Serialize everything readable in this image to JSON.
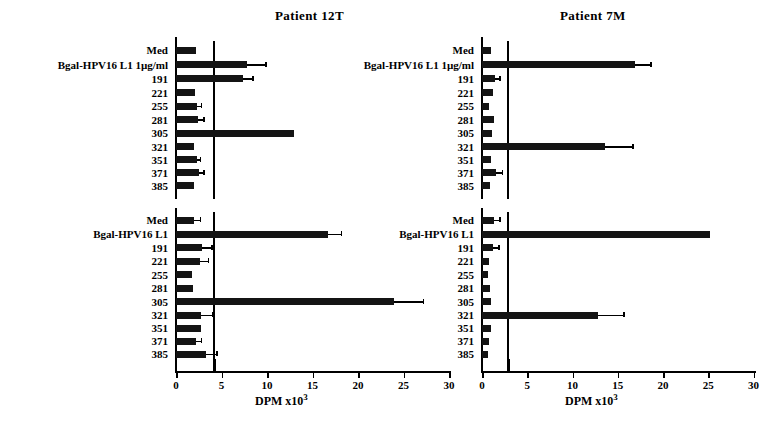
{
  "figure": {
    "width": 779,
    "height": 436,
    "background": "#ffffff",
    "ink_color": "#141414"
  },
  "axis_title": {
    "text": "DPM  x10",
    "exponent": "3"
  },
  "chart_data": {
    "type": "bar",
    "orientation": "horizontal",
    "title": "",
    "xlabel": "DPM x10³",
    "ylabel": "",
    "xlim": [
      0,
      30
    ],
    "xticks": [
      0,
      5,
      10,
      15,
      20,
      25,
      30
    ],
    "xtick_labels": [
      "0",
      "5",
      "10",
      "15",
      "20",
      "25",
      "30"
    ],
    "grid": false,
    "legend": false,
    "note": "Four panels: two patients (columns) x two assays (rows). Bars are mean DPM x10^3 with positive error bars. A vertical reference line marks the background/cut-off value in each panel.",
    "panels": [
      {
        "panel_id": "patient-12t-top",
        "patient": "Patient  12T",
        "column": "left",
        "row": "top",
        "reference_line_value": 4.1,
        "categories": [
          "Med",
          "Bgal-HPV16 L1  1µg/ml",
          "191",
          "221",
          "255",
          "281",
          "305",
          "321",
          "351",
          "371",
          "385"
        ],
        "values": [
          2.2,
          7.8,
          7.4,
          2.1,
          2.3,
          2.4,
          13.0,
          2.0,
          2.3,
          2.5,
          2.0
        ],
        "errors": [
          0.0,
          2.0,
          1.0,
          0.0,
          0.4,
          0.6,
          0.0,
          0.0,
          0.3,
          0.5,
          0.0
        ]
      },
      {
        "panel_id": "patient-12t-bottom",
        "patient": "",
        "column": "left",
        "row": "bottom",
        "reference_line_value": 4.1,
        "categories": [
          "Med",
          "Bgal-HPV16 L1",
          "191",
          "221",
          "255",
          "281",
          "305",
          "321",
          "351",
          "371",
          "385"
        ],
        "values": [
          2.0,
          16.7,
          2.9,
          2.6,
          1.8,
          1.9,
          24.0,
          2.8,
          2.7,
          2.2,
          3.3
        ],
        "errors": [
          0.6,
          1.4,
          1.0,
          0.9,
          0.0,
          0.0,
          3.1,
          1.2,
          0.0,
          0.5,
          1.1
        ]
      },
      {
        "panel_id": "patient-7m-top",
        "patient": "Patient  7M",
        "column": "right",
        "row": "top",
        "reference_line_value": 2.8,
        "categories": [
          "Med",
          "Bgal-HPV16 L1  1µg/ml",
          "191",
          "221",
          "255",
          "281",
          "305",
          "321",
          "351",
          "371",
          "385"
        ],
        "values": [
          1.0,
          16.9,
          1.4,
          1.2,
          0.8,
          1.3,
          1.1,
          13.6,
          1.0,
          1.5,
          0.9
        ],
        "errors": [
          0.0,
          1.7,
          0.5,
          0.0,
          0.0,
          0.0,
          0.0,
          3.0,
          0.0,
          0.7,
          0.0
        ]
      },
      {
        "panel_id": "patient-7m-bottom",
        "patient": "",
        "column": "right",
        "row": "bottom",
        "reference_line_value": 2.8,
        "categories": [
          "Med",
          "Bgal-HPV16 L1",
          "191",
          "221",
          "255",
          "281",
          "305",
          "321",
          "351",
          "371",
          "385"
        ],
        "values": [
          1.3,
          25.2,
          1.2,
          0.8,
          0.7,
          0.9,
          1.0,
          12.8,
          1.0,
          0.8,
          0.7
        ],
        "errors": [
          0.6,
          0.0,
          0.6,
          0.0,
          0.0,
          0.0,
          0.0,
          2.8,
          0.0,
          0.0,
          0.0
        ]
      }
    ]
  }
}
